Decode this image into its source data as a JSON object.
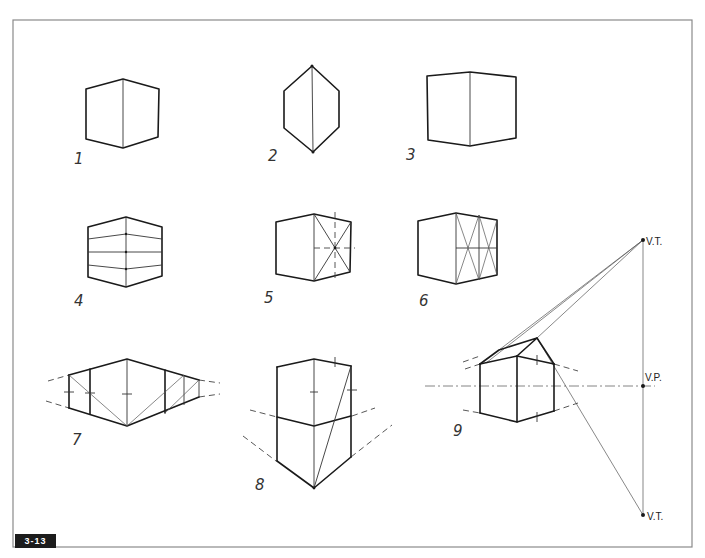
{
  "figure": {
    "id_badge": "3-13",
    "steps": [
      {
        "number": "1",
        "description": "basic cube, two-point view"
      },
      {
        "number": "2",
        "description": "narrow cube viewed from corner"
      },
      {
        "number": "3",
        "description": "cube with near-parallel faces"
      },
      {
        "number": "4",
        "description": "cube subdivided horizontally into equal bands"
      },
      {
        "number": "5",
        "description": "finding face center with diagonals"
      },
      {
        "number": "6",
        "description": "dividing a face using diagonals"
      },
      {
        "number": "7",
        "description": "extending a face using diagonals"
      },
      {
        "number": "8",
        "description": "stacking a cube using diagonal"
      },
      {
        "number": "9",
        "description": "pitched roof with vertical trace points"
      }
    ],
    "labels": {
      "vt_top": "V.T.",
      "vp": "V.P.",
      "vt_bottom": "V.T."
    },
    "colors": {
      "ink": "#1a1a1a",
      "frame": "#8a8a8a",
      "badge_bg": "#1c1c1c",
      "badge_text": "#ffffff"
    }
  }
}
